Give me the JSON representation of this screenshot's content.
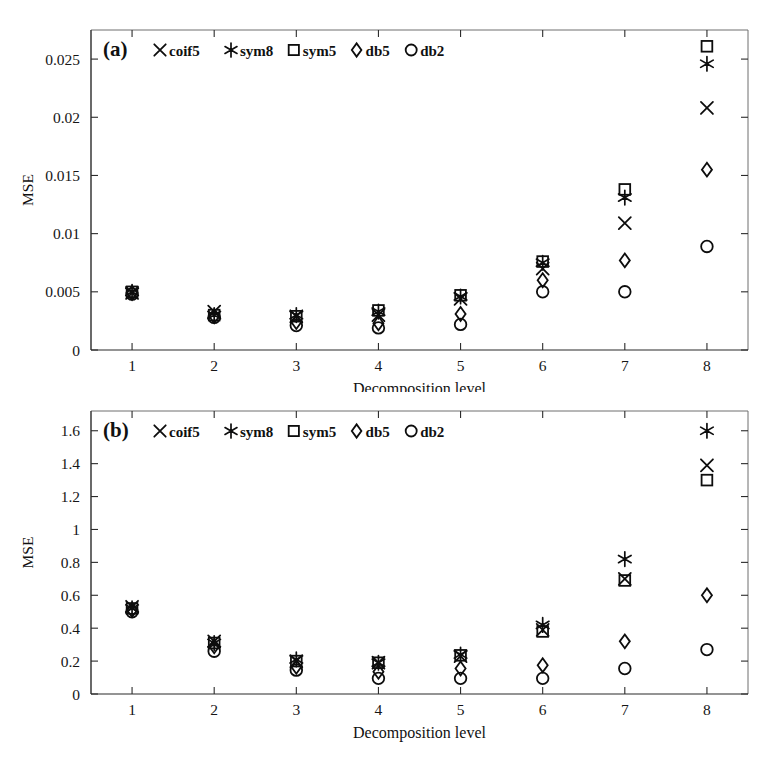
{
  "figure": {
    "background": "#ffffff",
    "marker_color": "#0d0d0d",
    "axis_color": "#2b2b2b"
  },
  "legend": {
    "series": [
      {
        "label": "coif5",
        "marker": "cross-icon"
      },
      {
        "label": "sym8",
        "marker": "asterisk-icon"
      },
      {
        "label": "sym5",
        "marker": "square-icon"
      },
      {
        "label": "db5",
        "marker": "diamond-icon"
      },
      {
        "label": "db2",
        "marker": "circle-icon"
      }
    ]
  },
  "panels": [
    {
      "tag": "(a)",
      "id": "a"
    },
    {
      "tag": "(b)",
      "id": "b"
    }
  ],
  "chart_data": [
    {
      "type": "scatter",
      "title": "(a)",
      "xlabel": "Decomposition level",
      "ylabel": "MSE",
      "x": [
        1,
        2,
        3,
        4,
        5,
        6,
        7,
        8
      ],
      "xlim": [
        0.5,
        8.5
      ],
      "ylim": [
        0,
        0.0275
      ],
      "xticks": [
        "1",
        "2",
        "3",
        "4",
        "5",
        "6",
        "7",
        "8"
      ],
      "yticks": [
        "0",
        "0.005",
        "0.01",
        "0.015",
        "0.02",
        "0.025"
      ],
      "ytickvalues": [
        0,
        0.005,
        0.01,
        0.015,
        0.02,
        0.025
      ],
      "grid": false,
      "legend_position": "top-left-inside",
      "series": [
        {
          "name": "coif5",
          "marker": "cross-icon",
          "values": [
            0.0049,
            0.0033,
            0.0029,
            0.003,
            0.0044,
            0.007,
            0.0109,
            0.0208
          ]
        },
        {
          "name": "sym8",
          "marker": "asterisk-icon",
          "values": [
            0.005,
            0.003,
            0.003,
            0.0033,
            0.0046,
            0.0075,
            0.0131,
            0.0246
          ]
        },
        {
          "name": "sym5",
          "marker": "square-icon",
          "values": [
            0.005,
            0.003,
            0.0029,
            0.0034,
            0.0047,
            0.0076,
            0.0138,
            0.0261
          ]
        },
        {
          "name": "db5",
          "marker": "diamond-icon",
          "values": [
            0.0049,
            0.0029,
            0.0024,
            0.0023,
            0.0031,
            0.006,
            0.0077,
            0.0155
          ]
        },
        {
          "name": "db2",
          "marker": "circle-icon",
          "values": [
            0.0048,
            0.0028,
            0.0021,
            0.0019,
            0.0022,
            0.005,
            0.005,
            0.0089
          ]
        }
      ]
    },
    {
      "type": "scatter",
      "title": "(b)",
      "xlabel": "Decomposition level",
      "ylabel": "MSE",
      "x": [
        1,
        2,
        3,
        4,
        5,
        6,
        7,
        8
      ],
      "xlim": [
        0.5,
        8.5
      ],
      "ylim": [
        0,
        1.72
      ],
      "xticks": [
        "1",
        "2",
        "3",
        "4",
        "5",
        "6",
        "7",
        "8"
      ],
      "yticks": [
        "0",
        "0.2",
        "0.4",
        "0.6",
        "0.8",
        "1",
        "1.2",
        "1.4",
        "1.6"
      ],
      "ytickvalues": [
        0,
        0.2,
        0.4,
        0.6,
        0.8,
        1.0,
        1.2,
        1.4,
        1.6
      ],
      "grid": false,
      "legend_position": "top-left-inside",
      "series": [
        {
          "name": "coif5",
          "marker": "cross-icon",
          "values": [
            0.53,
            0.32,
            0.2,
            0.19,
            0.23,
            0.39,
            0.7,
            1.39
          ]
        },
        {
          "name": "sym8",
          "marker": "asterisk-icon",
          "values": [
            0.52,
            0.31,
            0.21,
            0.19,
            0.24,
            0.42,
            0.82,
            1.6
          ]
        },
        {
          "name": "sym5",
          "marker": "square-icon",
          "values": [
            0.52,
            0.31,
            0.2,
            0.19,
            0.235,
            0.38,
            0.69,
            1.3
          ]
        },
        {
          "name": "db5",
          "marker": "diamond-icon",
          "values": [
            0.51,
            0.29,
            0.165,
            0.135,
            0.155,
            0.175,
            0.32,
            0.6
          ]
        },
        {
          "name": "db2",
          "marker": "circle-icon",
          "values": [
            0.5,
            0.26,
            0.145,
            0.095,
            0.095,
            0.095,
            0.155,
            0.27
          ]
        }
      ]
    }
  ]
}
